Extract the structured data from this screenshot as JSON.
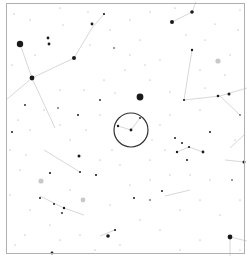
{
  "chart_data": {
    "type": "scatter",
    "title": "",
    "frame": {
      "x": 6,
      "y": 3,
      "w": 238,
      "h": 250,
      "color": "#b0b0b0"
    },
    "target_circle": {
      "cx": 131,
      "cy": 130,
      "r": 17,
      "color": "#333333"
    },
    "colors": {
      "star": "#1a1a1a",
      "line": "#d8d8d8",
      "faint": "#9a9a9a",
      "halo": "#bbbbbb"
    },
    "lines": [
      [
        [
          20,
          44
        ],
        [
          32,
          78
        ]
      ],
      [
        [
          32,
          78
        ],
        [
          74,
          58
        ]
      ],
      [
        [
          74,
          58
        ],
        [
          92,
          28
        ]
      ],
      [
        [
          92,
          28
        ],
        [
          104,
          14
        ]
      ],
      [
        [
          6,
          100
        ],
        [
          32,
          78
        ]
      ],
      [
        [
          32,
          78
        ],
        [
          55,
          128
        ]
      ],
      [
        [
          172,
          22
        ],
        [
          192,
          12
        ]
      ],
      [
        [
          192,
          12
        ],
        [
          196,
          2
        ]
      ],
      [
        [
          192,
          50
        ],
        [
          184,
          100
        ]
      ],
      [
        [
          184,
          100
        ],
        [
          220,
          96
        ]
      ],
      [
        [
          220,
          96
        ],
        [
          247,
          88
        ]
      ],
      [
        [
          220,
          96
        ],
        [
          240,
          115
        ]
      ],
      [
        [
          177,
          152
        ],
        [
          189,
          147
        ]
      ],
      [
        [
          189,
          147
        ],
        [
          203,
          152
        ]
      ],
      [
        [
          225,
          160
        ],
        [
          245,
          162
        ]
      ],
      [
        [
          230,
          148
        ],
        [
          244,
          135
        ]
      ],
      [
        [
          44,
          150
        ],
        [
          80,
          172
        ]
      ],
      [
        [
          40,
          196
        ],
        [
          64,
          208
        ]
      ],
      [
        [
          64,
          208
        ],
        [
          84,
          215
        ]
      ],
      [
        [
          118,
          126
        ],
        [
          131,
          130
        ]
      ],
      [
        [
          131,
          130
        ],
        [
          140,
          118
        ]
      ],
      [
        [
          230,
          237
        ],
        [
          230,
          256
        ]
      ],
      [
        [
          230,
          237
        ],
        [
          247,
          241
        ]
      ],
      [
        [
          165,
          196
        ],
        [
          190,
          190
        ]
      ],
      [
        [
          100,
          236
        ],
        [
          115,
          230
        ]
      ]
    ],
    "stars": [
      {
        "x": 20,
        "y": 44,
        "r": 3.2
      },
      {
        "x": 32,
        "y": 78,
        "r": 2.4
      },
      {
        "x": 74,
        "y": 58,
        "r": 2.0
      },
      {
        "x": 48,
        "y": 38,
        "r": 1.4
      },
      {
        "x": 49,
        "y": 44,
        "r": 1.4
      },
      {
        "x": 92,
        "y": 24,
        "r": 1.4
      },
      {
        "x": 104,
        "y": 14,
        "r": 1.1
      },
      {
        "x": 172,
        "y": 22,
        "r": 2.0
      },
      {
        "x": 192,
        "y": 12,
        "r": 1.8
      },
      {
        "x": 140,
        "y": 97,
        "r": 3.4
      },
      {
        "x": 192,
        "y": 50,
        "r": 1.2
      },
      {
        "x": 184,
        "y": 100,
        "r": 1.1
      },
      {
        "x": 218,
        "y": 96,
        "r": 1.3
      },
      {
        "x": 229,
        "y": 94,
        "r": 1.5
      },
      {
        "x": 240,
        "y": 115,
        "r": 0.8
      },
      {
        "x": 131,
        "y": 130,
        "r": 1.4
      },
      {
        "x": 118,
        "y": 126,
        "r": 1.2
      },
      {
        "x": 140,
        "y": 118,
        "r": 0.9
      },
      {
        "x": 177,
        "y": 152,
        "r": 1.2
      },
      {
        "x": 189,
        "y": 147,
        "r": 1.1
      },
      {
        "x": 203,
        "y": 152,
        "r": 1.4
      },
      {
        "x": 244,
        "y": 162,
        "r": 1.5
      },
      {
        "x": 162,
        "y": 191,
        "r": 1.0
      },
      {
        "x": 134,
        "y": 198,
        "r": 1.0
      },
      {
        "x": 230,
        "y": 237,
        "r": 2.4
      },
      {
        "x": 79,
        "y": 156,
        "r": 1.5
      },
      {
        "x": 80,
        "y": 172,
        "r": 1.0
      },
      {
        "x": 40,
        "y": 198,
        "r": 1.0
      },
      {
        "x": 54,
        "y": 204,
        "r": 1.0
      },
      {
        "x": 64,
        "y": 208,
        "r": 1.2
      },
      {
        "x": 62,
        "y": 213,
        "r": 0.9
      },
      {
        "x": 108,
        "y": 236,
        "r": 1.8
      },
      {
        "x": 115,
        "y": 230,
        "r": 1.1
      },
      {
        "x": 52,
        "y": 253,
        "r": 1.4
      },
      {
        "x": 96,
        "y": 175,
        "r": 1.1
      },
      {
        "x": 50,
        "y": 173,
        "r": 1.1
      },
      {
        "x": 12,
        "y": 132,
        "r": 1.0
      },
      {
        "x": 25,
        "y": 105,
        "r": 0.9
      },
      {
        "x": 58,
        "y": 108,
        "r": 0.8
      },
      {
        "x": 100,
        "y": 100,
        "r": 0.9
      },
      {
        "x": 78,
        "y": 115,
        "r": 1.0
      },
      {
        "x": 114,
        "y": 48,
        "r": 0.8
      },
      {
        "x": 210,
        "y": 132,
        "r": 1.0
      },
      {
        "x": 175,
        "y": 138,
        "r": 1.0
      },
      {
        "x": 182,
        "y": 143,
        "r": 1.0
      },
      {
        "x": 187,
        "y": 160,
        "r": 1.0
      },
      {
        "x": 150,
        "y": 200,
        "r": 0.8
      },
      {
        "x": 232,
        "y": 180,
        "r": 0.8
      }
    ],
    "halo_stars": [
      {
        "x": 218,
        "y": 61,
        "r": 2.6
      },
      {
        "x": 41,
        "y": 181,
        "r": 2.6
      },
      {
        "x": 83,
        "y": 200,
        "r": 2.4
      }
    ],
    "faint_stars": [
      [
        14,
        14
      ],
      [
        30,
        20
      ],
      [
        60,
        8
      ],
      [
        88,
        12
      ],
      [
        110,
        30
      ],
      [
        130,
        20
      ],
      [
        150,
        12
      ],
      [
        205,
        40
      ],
      [
        238,
        30
      ],
      [
        215,
        24
      ],
      [
        140,
        40
      ],
      [
        160,
        60
      ],
      [
        186,
        35
      ],
      [
        200,
        70
      ],
      [
        225,
        75
      ],
      [
        150,
        80
      ],
      [
        125,
        70
      ],
      [
        104,
        80
      ],
      [
        84,
        90
      ],
      [
        60,
        90
      ],
      [
        44,
        110
      ],
      [
        18,
        120
      ],
      [
        10,
        150
      ],
      [
        26,
        155
      ],
      [
        60,
        125
      ],
      [
        100,
        115
      ],
      [
        112,
        150
      ],
      [
        150,
        160
      ],
      [
        165,
        150
      ],
      [
        120,
        165
      ],
      [
        100,
        160
      ],
      [
        70,
        140
      ],
      [
        30,
        130
      ],
      [
        20,
        170
      ],
      [
        10,
        195
      ],
      [
        30,
        210
      ],
      [
        50,
        225
      ],
      [
        80,
        235
      ],
      [
        95,
        250
      ],
      [
        120,
        245
      ],
      [
        140,
        220
      ],
      [
        160,
        230
      ],
      [
        180,
        210
      ],
      [
        200,
        200
      ],
      [
        220,
        215
      ],
      [
        240,
        200
      ],
      [
        210,
        180
      ],
      [
        190,
        175
      ],
      [
        170,
        175
      ],
      [
        150,
        180
      ],
      [
        130,
        185
      ],
      [
        110,
        205
      ],
      [
        70,
        190
      ],
      [
        25,
        235
      ],
      [
        15,
        245
      ],
      [
        60,
        240
      ],
      [
        200,
        240
      ],
      [
        180,
        250
      ],
      [
        240,
        250
      ],
      [
        235,
        140
      ],
      [
        200,
        110
      ],
      [
        170,
        115
      ],
      [
        160,
        125
      ],
      [
        230,
        55
      ],
      [
        240,
        10
      ],
      [
        175,
        8
      ],
      [
        63,
        25
      ],
      [
        35,
        55
      ],
      [
        12,
        65
      ],
      [
        90,
        45
      ],
      [
        130,
        55
      ],
      [
        145,
        65
      ],
      [
        205,
        88
      ],
      [
        170,
        92
      ],
      [
        115,
        93
      ],
      [
        86,
        130
      ],
      [
        152,
        140
      ]
    ]
  }
}
